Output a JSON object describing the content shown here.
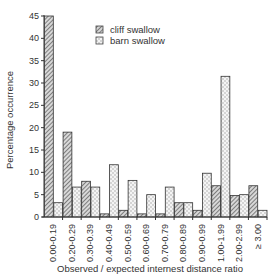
{
  "chart_data": {
    "type": "bar",
    "title": "",
    "xlabel": "Observed / expected internest distance ratio",
    "ylabel": "Percentage occurrence",
    "ylim": [
      0,
      45
    ],
    "yticks": [
      0,
      5,
      10,
      15,
      20,
      25,
      30,
      35,
      40,
      45
    ],
    "grid": false,
    "legend_position": "upper right",
    "categories": [
      "0.00-0.19",
      "0.20-0.29",
      "0.30-0.39",
      "0.40-0.49",
      "0.50-0.59",
      "0.60-0.69",
      "0.70-0.79",
      "0.80-0.89",
      "0.90-0.99",
      "1.00-1.99",
      "2.00-2.99",
      "≥ 3.00"
    ],
    "series": [
      {
        "name": "cliff swallow",
        "pattern": "diagonal-hatch",
        "values": [
          45,
          19,
          8,
          0.7,
          1.5,
          0.7,
          0.7,
          3.2,
          1.5,
          7,
          4.8,
          7
        ]
      },
      {
        "name": "barn swallow",
        "pattern": "dotted-cross",
        "values": [
          3.2,
          6.7,
          6.7,
          11.7,
          8.2,
          5,
          6.7,
          3.2,
          9.8,
          31.5,
          5,
          1.5
        ]
      }
    ]
  },
  "legend": {
    "items": [
      {
        "label": "cliff swallow"
      },
      {
        "label": "barn swallow"
      }
    ]
  },
  "axes": {
    "xlabel": "Observed / expected internest distance ratio",
    "ylabel": "Percentage occurrence"
  }
}
